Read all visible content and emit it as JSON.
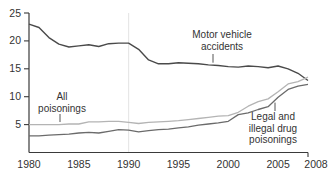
{
  "chart_data": {
    "type": "line",
    "title": "",
    "xlabel": "",
    "ylabel": "",
    "xlim": [
      1980,
      2008
    ],
    "ylim": [
      0,
      25
    ],
    "xticks": [
      1980,
      1985,
      1990,
      1995,
      2000,
      2005,
      2008
    ],
    "yticks": [
      5,
      10,
      15,
      20,
      25
    ],
    "grid": "single faint vertical gridline at 1990",
    "legend_position": "inline annotations with leader ticks",
    "x": [
      1980,
      1981,
      1982,
      1983,
      1984,
      1985,
      1986,
      1987,
      1988,
      1989,
      1990,
      1991,
      1992,
      1993,
      1994,
      1995,
      1996,
      1997,
      1998,
      1999,
      2000,
      2001,
      2002,
      2003,
      2004,
      2005,
      2006,
      2007,
      2008
    ],
    "series": [
      {
        "name": "Motor vehicle accidents",
        "color": "#4a4a4a",
        "values": [
          23.0,
          22.4,
          20.6,
          19.4,
          18.9,
          19.1,
          19.3,
          19.0,
          19.5,
          19.6,
          19.6,
          18.5,
          16.6,
          15.9,
          15.9,
          16.1,
          16.0,
          15.9,
          15.7,
          15.6,
          15.4,
          15.3,
          15.5,
          15.4,
          15.2,
          15.5,
          15.0,
          14.2,
          12.9
        ]
      },
      {
        "name": "All poisonings",
        "color": "#b4b4b4",
        "values": [
          5.0,
          5.0,
          5.0,
          5.0,
          5.1,
          5.1,
          5.5,
          5.5,
          5.6,
          5.6,
          5.4,
          5.2,
          5.4,
          5.5,
          5.6,
          5.7,
          5.9,
          6.1,
          6.3,
          6.5,
          6.6,
          7.2,
          8.3,
          9.1,
          9.6,
          10.9,
          12.3,
          12.7,
          13.5
        ]
      },
      {
        "name": "Legal and illegal drug poisonings",
        "color": "#6b6b6b",
        "values": [
          3.0,
          3.0,
          3.1,
          3.2,
          3.3,
          3.5,
          3.6,
          3.5,
          3.8,
          4.1,
          4.0,
          3.7,
          3.9,
          4.1,
          4.2,
          4.4,
          4.6,
          4.9,
          5.1,
          5.3,
          5.6,
          6.8,
          7.1,
          7.7,
          8.2,
          9.9,
          11.3,
          11.9,
          12.2
        ]
      }
    ],
    "annotations": [
      {
        "series": "Motor vehicle accidents",
        "lines": [
          "Motor vehicle",
          "accidents"
        ]
      },
      {
        "series": "All poisonings",
        "lines": [
          "All",
          "poisonings"
        ]
      },
      {
        "series": "Legal and illegal drug poisonings",
        "lines": [
          "Legal and",
          "illegal drug",
          "poisonings"
        ]
      }
    ],
    "axis_color": "#3a3a3a",
    "gridline_color": "#e4e4e4",
    "text_color": "#333333"
  }
}
